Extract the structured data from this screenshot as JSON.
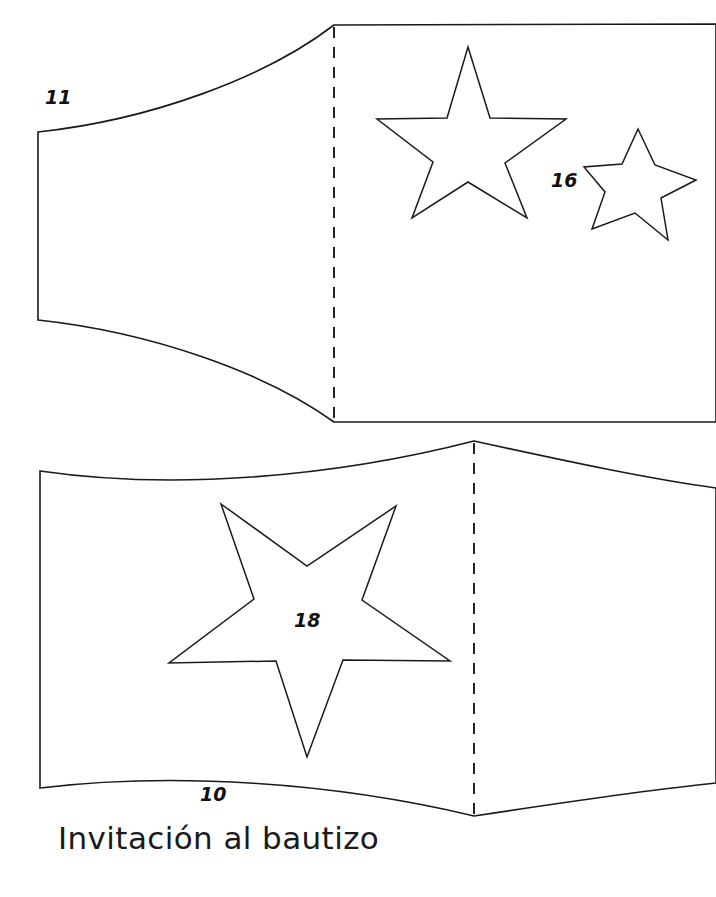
{
  "document": {
    "title": "Invitación al bautizo",
    "caption": "Invitación al bautizo",
    "line_color": "#1a1a1a",
    "background_color": "#ffffff"
  },
  "labels": {
    "top_panel_left": "11",
    "top_panel_small_star": "16",
    "bottom_panel_bottom": "10",
    "bottom_panel_star": "18"
  },
  "pieces": [
    {
      "name": "top-piece",
      "label": "11",
      "fold": "vertical-dashed",
      "stars": [
        {
          "name": "large-star",
          "label": "",
          "orientation": "point-up"
        },
        {
          "name": "small-star",
          "label": "16",
          "orientation": "point-up-tilted"
        }
      ]
    },
    {
      "name": "bottom-piece",
      "label": "10",
      "fold": "vertical-dashed",
      "stars": [
        {
          "name": "cutout-star",
          "label": "18",
          "orientation": "point-down"
        }
      ]
    }
  ]
}
